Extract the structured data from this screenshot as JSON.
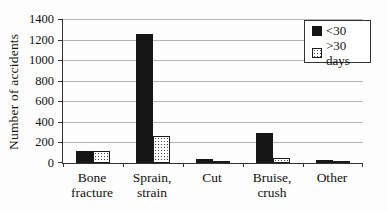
{
  "chart_data": {
    "type": "bar",
    "title": "",
    "xlabel": "",
    "ylabel": "Number of accidents",
    "ylim": [
      0,
      1400
    ],
    "ytick_step": 200,
    "grid": true,
    "legend_position": "top-right-inside",
    "categories": [
      "Bone fracture",
      "Sprain, strain",
      "Cut",
      "Bruise, crush",
      "Other"
    ],
    "series": [
      {
        "name": "<30",
        "fill": "solid-black",
        "color": "#161616",
        "values": [
          120,
          1250,
          35,
          290,
          25
        ]
      },
      {
        "name": ">30 days",
        "fill": "stipple-dots",
        "color": "#ffffff",
        "values": [
          120,
          265,
          15,
          50,
          10
        ]
      }
    ],
    "colors": {
      "background": "#fdfdfd",
      "gridline": "#b3b3b3",
      "axis": "#333333",
      "text": "#111111"
    }
  }
}
